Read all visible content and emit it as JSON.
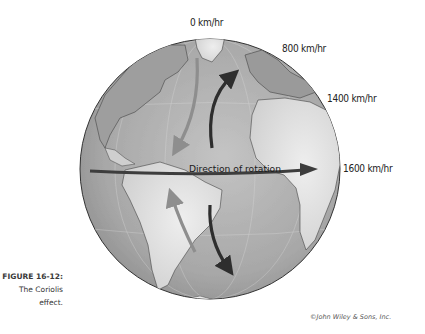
{
  "figure": {
    "number": "FIGURE 16-12:",
    "caption_line1": "The Coriolis",
    "caption_line2": "effect.",
    "credit": "©John Wiley & Sons, Inc."
  },
  "diagram": {
    "rotation_label": "Direction of rotation",
    "speed_labels": [
      {
        "latitude": "pole",
        "text": "0 km/hr"
      },
      {
        "latitude": "high",
        "text": "800 km/hr"
      },
      {
        "latitude": "mid",
        "text": "1400 km/hr"
      },
      {
        "latitude": "equator",
        "text": "1600 km/hr"
      }
    ],
    "arrows": [
      {
        "hemisphere": "northern",
        "type": "intended",
        "shade": "light",
        "direction": "southward, deflected right"
      },
      {
        "hemisphere": "northern",
        "type": "actual",
        "shade": "dark",
        "direction": "northward, deflected right"
      },
      {
        "hemisphere": "southern",
        "type": "intended",
        "shade": "light",
        "direction": "northward, deflected left"
      },
      {
        "hemisphere": "southern",
        "type": "actual",
        "shade": "dark",
        "direction": "southward, deflected left"
      }
    ],
    "colors": {
      "ocean": "#a9a9a9",
      "land": "#dcdcdc",
      "land_dark": "#9a9a9a",
      "dark_arrow": "#2e2e2e",
      "light_arrow": "#8e8e8e",
      "rotation_arrow": "#3d3d3d"
    }
  }
}
